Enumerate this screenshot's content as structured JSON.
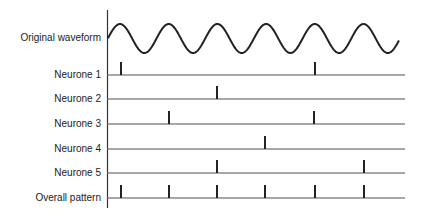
{
  "diagram": {
    "title": "",
    "axis": {
      "x": 107.5,
      "y_top": 10,
      "y_bottom": 208,
      "color": "#333333"
    },
    "baseline_end_x": 405,
    "baseline_color": "#8a8a8a",
    "spike_color": "#222222",
    "spike_height": 13,
    "waveform": {
      "label": "Original waveform",
      "label_y": 38,
      "center_y": 38.5,
      "amplitude": 14.5,
      "start_x": 108,
      "end_x": 399,
      "first_peak_x": 120,
      "period": 48.7,
      "color": "#222222"
    },
    "rows": [
      {
        "label": "Neurone 1",
        "baseline_y": 75,
        "spikes_x": [
          121,
          315
        ]
      },
      {
        "label": "Neurone 2",
        "baseline_y": 99,
        "spikes_x": [
          217
        ]
      },
      {
        "label": "Neurone 3",
        "baseline_y": 124,
        "spikes_x": [
          169,
          314
        ]
      },
      {
        "label": "Neurone 4",
        "baseline_y": 149,
        "spikes_x": [
          265
        ]
      },
      {
        "label": "Neurone 5",
        "baseline_y": 173,
        "spikes_x": [
          217,
          364
        ]
      },
      {
        "label": "Overall pattern",
        "baseline_y": 198,
        "spikes_x": [
          121,
          169,
          217,
          265,
          315,
          364
        ]
      }
    ]
  }
}
